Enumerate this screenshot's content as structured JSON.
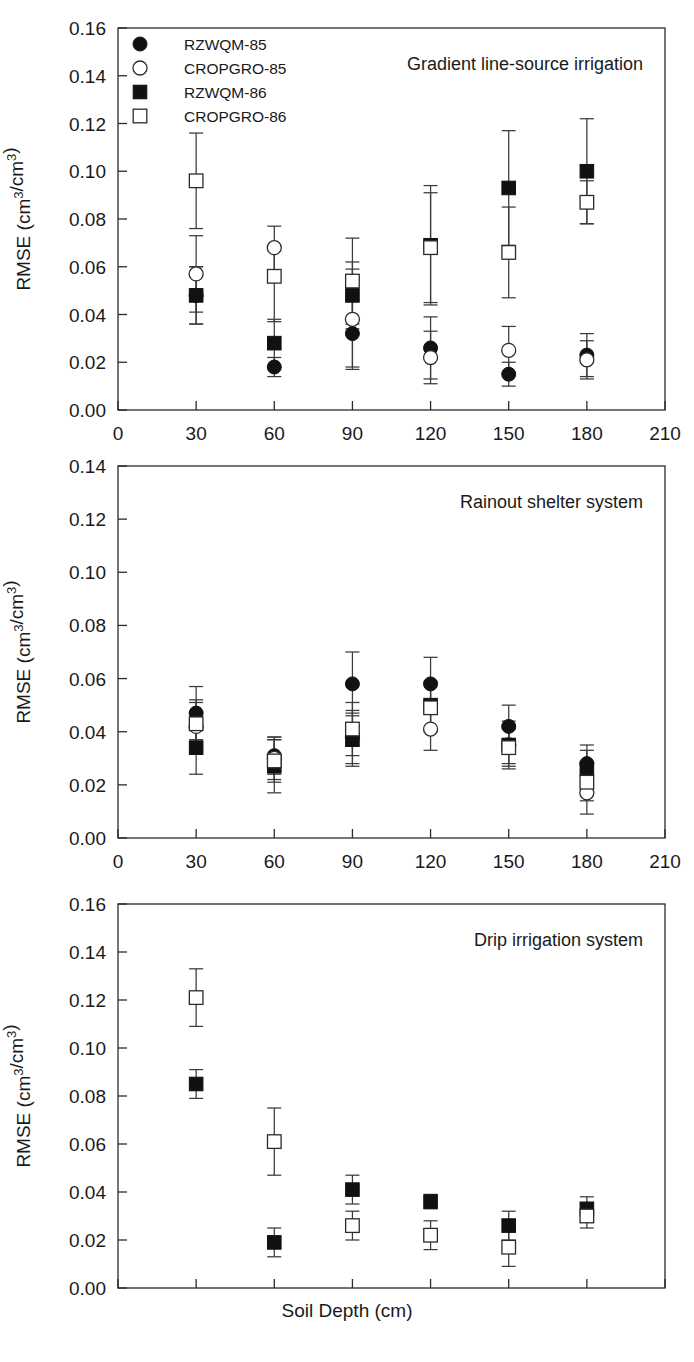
{
  "figure": {
    "xlabel": "Soil Depth (cm)",
    "ylabel": "RMSE (cm3/cm3)",
    "ylabel_base": "RMSE (cm",
    "ylabel_sup1": "3",
    "ylabel_mid": "/cm",
    "ylabel_sup2": "3",
    "ylabel_end": ")"
  },
  "legend": {
    "items": [
      {
        "label": "RZWQM-85",
        "marker": "filled-circle"
      },
      {
        "label": "CROPGRO-85",
        "marker": "open-circle"
      },
      {
        "label": "RZWQM-86",
        "marker": "filled-square"
      },
      {
        "label": "CROPGRO-86",
        "marker": "open-square"
      }
    ]
  },
  "x_ticks": [
    "0",
    "30",
    "60",
    "90",
    "120",
    "150",
    "180",
    "210"
  ],
  "y_ticks_016": [
    "0.00",
    "0.02",
    "0.04",
    "0.06",
    "0.08",
    "0.10",
    "0.12",
    "0.14",
    "0.16"
  ],
  "y_ticks_014": [
    "0.00",
    "0.02",
    "0.04",
    "0.06",
    "0.08",
    "0.10",
    "0.12",
    "0.14"
  ],
  "chart_data": [
    {
      "type": "scatter",
      "title": "Gradient line-source irrigation",
      "xlabel": "Soil Depth (cm)",
      "ylabel": "RMSE (cm3/cm3)",
      "xlim": [
        0,
        210
      ],
      "ylim": [
        0.0,
        0.16
      ],
      "xticks": [
        0,
        30,
        60,
        90,
        120,
        150,
        180,
        210
      ],
      "yticks": [
        0.0,
        0.02,
        0.04,
        0.06,
        0.08,
        0.1,
        0.12,
        0.14,
        0.16
      ],
      "grid": false,
      "legend_position": "top-left",
      "categories": [
        30,
        60,
        90,
        120,
        150,
        180
      ],
      "series": [
        {
          "name": "RZWQM-85",
          "marker": "filled-circle",
          "values": [
            0.048,
            0.018,
            0.032,
            0.026,
            0.015,
            0.023
          ],
          "err_low": [
            0.012,
            0.004,
            0.014,
            0.013,
            0.005,
            0.009
          ],
          "err_high": [
            0.012,
            0.004,
            0.014,
            0.013,
            0.005,
            0.009
          ]
        },
        {
          "name": "CROPGRO-85",
          "marker": "open-circle",
          "values": [
            0.057,
            0.068,
            0.038,
            0.022,
            0.025,
            0.021
          ],
          "err_low": [
            0.016,
            0.012,
            0.021,
            0.011,
            0.01,
            0.008
          ],
          "err_high": [
            0.016,
            0.009,
            0.021,
            0.011,
            0.01,
            0.008
          ]
        },
        {
          "name": "RZWQM-86",
          "marker": "filled-square",
          "values": [
            0.048,
            0.028,
            0.048,
            0.069,
            0.093,
            0.1
          ],
          "err_low": [
            0.012,
            0.01,
            0.014,
            0.025,
            0.024,
            0.022
          ],
          "err_high": [
            0.012,
            0.01,
            0.014,
            0.025,
            0.024,
            0.022
          ]
        },
        {
          "name": "CROPGRO-86",
          "marker": "open-square",
          "values": [
            0.096,
            0.056,
            0.054,
            0.068,
            0.066,
            0.087
          ],
          "err_low": [
            0.02,
            0.019,
            0.018,
            0.023,
            0.019,
            0.009
          ],
          "err_high": [
            0.02,
            0.012,
            0.018,
            0.023,
            0.019,
            0.009
          ]
        }
      ]
    },
    {
      "type": "scatter",
      "title": "Rainout shelter system",
      "xlabel": "Soil Depth (cm)",
      "ylabel": "RMSE (cm3/cm3)",
      "xlim": [
        0,
        210
      ],
      "ylim": [
        0.0,
        0.14
      ],
      "xticks": [
        0,
        30,
        60,
        90,
        120,
        150,
        180,
        210
      ],
      "yticks": [
        0.0,
        0.02,
        0.04,
        0.06,
        0.08,
        0.1,
        0.12,
        0.14
      ],
      "grid": false,
      "legend_position": "none",
      "categories": [
        30,
        60,
        90,
        120,
        150,
        180
      ],
      "series": [
        {
          "name": "RZWQM-85",
          "marker": "filled-circle",
          "values": [
            0.047,
            0.031,
            0.058,
            0.058,
            0.042,
            0.028
          ],
          "err_low": [
            0.01,
            0.007,
            0.012,
            0.01,
            0.008,
            0.007
          ],
          "err_high": [
            0.01,
            0.007,
            0.012,
            0.01,
            0.008,
            0.007
          ]
        },
        {
          "name": "CROPGRO-85",
          "marker": "open-circle",
          "values": [
            0.042,
            0.03,
            0.038,
            0.041,
            0.035,
            0.017
          ],
          "err_low": [
            0.009,
            0.008,
            0.01,
            0.008,
            0.009,
            0.008
          ],
          "err_high": [
            0.009,
            0.008,
            0.01,
            0.008,
            0.009,
            0.008
          ]
        },
        {
          "name": "RZWQM-86",
          "marker": "filled-square",
          "values": [
            0.034,
            0.027,
            0.037,
            0.05,
            0.035,
            0.026
          ],
          "err_low": [
            0.01,
            0.01,
            0.01,
            0.009,
            0.007,
            0.007
          ],
          "err_high": [
            0.01,
            0.01,
            0.01,
            0.009,
            0.007,
            0.007
          ]
        },
        {
          "name": "CROPGRO-86",
          "marker": "open-square",
          "values": [
            0.043,
            0.029,
            0.041,
            0.049,
            0.034,
            0.021
          ],
          "err_low": [
            0.009,
            0.008,
            0.01,
            0.009,
            0.007,
            0.007
          ],
          "err_high": [
            0.009,
            0.008,
            0.01,
            0.009,
            0.007,
            0.007
          ]
        }
      ]
    },
    {
      "type": "scatter",
      "title": "Drip irrigation system",
      "xlabel": "Soil Depth (cm)",
      "ylabel": "RMSE (cm3/cm3)",
      "xlim": [
        0,
        210
      ],
      "ylim": [
        0.0,
        0.16
      ],
      "xticks": [
        0,
        30,
        60,
        90,
        120,
        150,
        180,
        210
      ],
      "yticks": [
        0.0,
        0.02,
        0.04,
        0.06,
        0.08,
        0.1,
        0.12,
        0.14,
        0.16
      ],
      "grid": false,
      "legend_position": "none",
      "categories": [
        30,
        60,
        90,
        120,
        150,
        180
      ],
      "series": [
        {
          "name": "RZWQM-86",
          "marker": "filled-square",
          "values": [
            0.085,
            0.019,
            0.041,
            0.036,
            0.026,
            0.033
          ],
          "err_low": [
            0.006,
            0.006,
            0.006,
            0.003,
            0.006,
            0.005
          ],
          "err_high": [
            0.006,
            0.006,
            0.006,
            0.003,
            0.006,
            0.005
          ]
        },
        {
          "name": "CROPGRO-86",
          "marker": "open-square",
          "values": [
            0.121,
            0.061,
            0.026,
            0.022,
            0.017,
            0.03
          ],
          "err_low": [
            0.012,
            0.014,
            0.006,
            0.006,
            0.008,
            0.005
          ],
          "err_high": [
            0.012,
            0.014,
            0.006,
            0.006,
            0.008,
            0.005
          ]
        }
      ]
    }
  ]
}
